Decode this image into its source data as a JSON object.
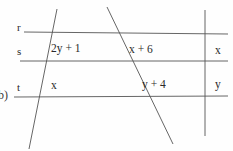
{
  "figure": {
    "part_marker": "b)",
    "width": 233,
    "height": 151,
    "ink_color": "#555555",
    "text_color": "#2a2a2a"
  },
  "parallel_lines": [
    {
      "name": "r",
      "label": "r",
      "y": 32
    },
    {
      "name": "s",
      "label": "s",
      "y": 61
    },
    {
      "name": "t",
      "label": "t",
      "y": 97
    }
  ],
  "transversals": [
    {
      "name": "transversal-left",
      "x1": 57,
      "y1": 9,
      "x2": 29,
      "y2": 149
    },
    {
      "name": "transversal-middle",
      "x1": 107,
      "y1": 7,
      "x2": 173,
      "y2": 144
    },
    {
      "name": "transversal-right-vertical",
      "x1": 205,
      "y1": 10,
      "x2": 205,
      "y2": 136
    }
  ],
  "segment_labels": [
    {
      "name": "segment-2y-plus-1",
      "text": "2y + 1",
      "x": 51,
      "y": 43
    },
    {
      "name": "segment-x-plus-6",
      "text": "x + 6",
      "x": 129,
      "y": 44
    },
    {
      "name": "segment-x",
      "text": "x",
      "x": 51,
      "y": 80
    },
    {
      "name": "segment-y-plus-4",
      "text": "y + 4",
      "x": 142,
      "y": 79
    }
  ],
  "edge_labels": [
    {
      "name": "edge-label-x",
      "text": "x",
      "x": 215,
      "y": 45
    },
    {
      "name": "edge-label-y",
      "text": "y",
      "x": 215,
      "y": 79
    }
  ]
}
